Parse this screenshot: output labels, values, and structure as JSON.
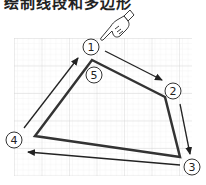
{
  "header": {
    "cropped_text": "绘制线段和多边形"
  },
  "diagram": {
    "grid": {
      "x": 14,
      "y": 38,
      "width": 178,
      "height": 138,
      "minor": 5.5,
      "major": 27.5,
      "color_minor": "#e6e6e6",
      "color_major": "#cfcfcf"
    },
    "polygon": {
      "points": [
        [
          92,
          60
        ],
        [
          165,
          97
        ],
        [
          180,
          157
        ],
        [
          35,
          136
        ]
      ],
      "stroke": "#333333",
      "stroke_width": 2.5
    },
    "steps": [
      {
        "label": "1",
        "cx": 91,
        "cy": 47
      },
      {
        "label": "2",
        "cx": 173,
        "cy": 91
      },
      {
        "label": "3",
        "cx": 192,
        "cy": 167
      },
      {
        "label": "4",
        "cx": 14,
        "cy": 140
      },
      {
        "label": "5",
        "cx": 94,
        "cy": 75
      }
    ],
    "arrows": [
      {
        "from": "1",
        "to": "2",
        "x1": 105,
        "y1": 51,
        "x2": 162,
        "y2": 80
      },
      {
        "from": "2",
        "to": "3",
        "x1": 180,
        "y1": 104,
        "x2": 190,
        "y2": 154
      },
      {
        "from": "3",
        "to": "4",
        "x1": 180,
        "y1": 165,
        "x2": 28,
        "y2": 152
      },
      {
        "from": "4",
        "to": "1",
        "x1": 24,
        "y1": 128,
        "x2": 78,
        "y2": 58
      }
    ],
    "cursor": {
      "type": "pointing-hand-icon",
      "x": 118,
      "y": 18
    }
  }
}
